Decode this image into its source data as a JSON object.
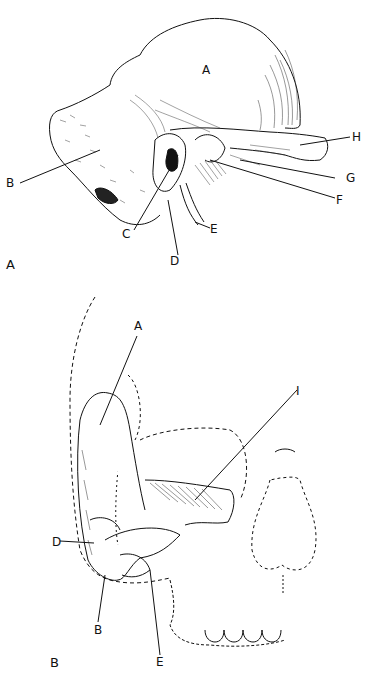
{
  "figure_a": {
    "panel_label": "A",
    "labels": {
      "A": "A",
      "B": "B",
      "C": "C",
      "D": "D",
      "E": "E",
      "F": "F",
      "G": "G",
      "H": "H"
    }
  },
  "figure_b": {
    "panel_label": "B",
    "labels": {
      "A": "A",
      "I": "I",
      "D": "D",
      "B": "B",
      "E": "E"
    }
  },
  "colors": {
    "ink": "#111111",
    "background": "#ffffff"
  }
}
